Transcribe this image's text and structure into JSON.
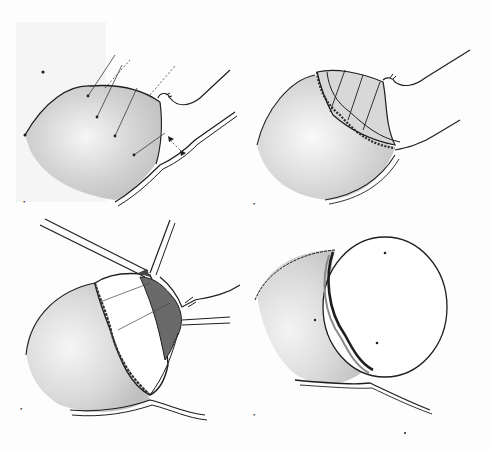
{
  "figure": {
    "type": "surgical-illustration",
    "style": "monochrome pen-and-wash sketch",
    "colors": {
      "ink": "#1e1e1e",
      "wash": "#cfcfcf",
      "wash_light": "#e6e6e6",
      "dark_tissue": "#6a6a6a",
      "background": "#fdfdfd"
    },
    "panels": [
      {
        "id": "a",
        "label": "•",
        "position": "top-left",
        "description": "Spherical mass with traction sutures placed across its upper surface, stalk with vessels at right, arrows indicating direction"
      },
      {
        "id": "b",
        "label": "•",
        "position": "top-right",
        "description": "Mass with a circumferential suture band placed around the stalk base, radial lines across cap"
      },
      {
        "id": "c",
        "label": "•",
        "position": "bottom-left",
        "description": "Instruments (forceps) applied at the incision; dissected cap partially separated, darker exposed tissue near vascular pedicle"
      },
      {
        "id": "d",
        "label": "•",
        "position": "bottom-right",
        "description": "Final result: large round structure separated with a thickened rim, single vessel trailing below"
      }
    ]
  }
}
